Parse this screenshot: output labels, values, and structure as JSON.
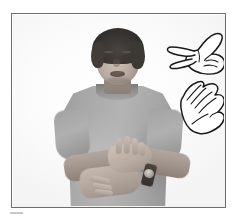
{
  "page": {
    "background_color": "#ffffff",
    "width": 236,
    "height": 222
  },
  "frame": {
    "border_color": "#6e6e6e",
    "fill_color": "#fdfdfd",
    "caption": ""
  },
  "photo": {
    "type": "grayscale photograph",
    "subject_description": "Woman with short dark hair wearing a gray short-sleeve t-shirt, shown from the waist up against a plain white background, performing a sign with both hands at waist level",
    "hair_color": "#3a3633",
    "skin_color": "#b8aaa0",
    "shirt_color": "#a8a8a8",
    "background_color": "#fbfbfb",
    "accessory_label": "wristwatch",
    "accessory_color": "#35302c"
  },
  "handshapes": [
    {
      "name": "handshape-v",
      "label": "V handshape",
      "description": "Line-drawn right hand with index and middle fingers extended and spread, thumb out, remaining fingers curled, oriented pointing left",
      "stroke_color": "#1a1a1a",
      "fill_color": "#ffffff"
    },
    {
      "name": "handshape-b",
      "label": "B handshape",
      "description": "Line-drawn flat open hand with fingers together and extended, thumb tucked along the palm edge, angled upward to the left",
      "stroke_color": "#1a1a1a",
      "fill_color": "#ffffff"
    }
  ],
  "marks": {
    "corner_mark_color": "#c9c9c9"
  }
}
